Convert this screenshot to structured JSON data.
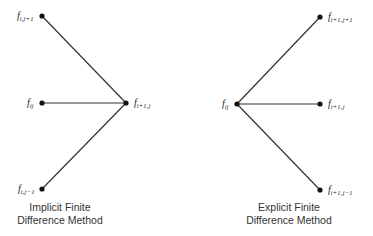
{
  "diagrams": [
    {
      "name": "implicit",
      "caption_line1": "Implicit Finite",
      "caption_line2": "Difference Method",
      "nodes": [
        {
          "id": "top",
          "base": "f",
          "sub": "i,j+1",
          "x": 42,
          "y": 16
        },
        {
          "id": "mid",
          "base": "f",
          "sub": "ij",
          "x": 42,
          "y": 103
        },
        {
          "id": "bottom",
          "base": "f",
          "sub": "i,j−1",
          "x": 42,
          "y": 189
        },
        {
          "id": "target",
          "base": "f",
          "sub": "i+1,j",
          "x": 126,
          "y": 103
        }
      ],
      "edges": [
        [
          "top",
          "target"
        ],
        [
          "mid",
          "target"
        ],
        [
          "bottom",
          "target"
        ]
      ]
    },
    {
      "name": "explicit",
      "caption_line1": "Explicit Finite",
      "caption_line2": "Difference Method",
      "nodes": [
        {
          "id": "source",
          "base": "f",
          "sub": "ij",
          "x": 237,
          "y": 104
        },
        {
          "id": "top",
          "base": "f",
          "sub": "i+1,j+1",
          "x": 320,
          "y": 17
        },
        {
          "id": "mid",
          "base": "f",
          "sub": "i+1,j",
          "x": 320,
          "y": 104
        },
        {
          "id": "bottom",
          "base": "f",
          "sub": "i+1,j−1",
          "x": 320,
          "y": 190
        }
      ],
      "edges": [
        [
          "source",
          "top"
        ],
        [
          "source",
          "mid"
        ],
        [
          "source",
          "bottom"
        ]
      ]
    }
  ],
  "colors": {
    "line": "#333333",
    "node": "#111111",
    "text": "#222222"
  }
}
